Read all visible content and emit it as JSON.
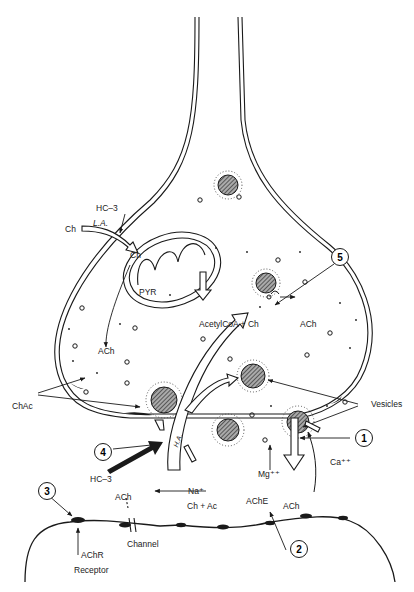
{
  "diagram": {
    "type": "cholinergic synapse schematic",
    "presynaptic": {
      "labels": {
        "hc3_top": "HC–3",
        "ch_outside": "Ch",
        "la": "L.A.",
        "ch_inside": "Ch",
        "pyr": "PYR",
        "ach_left": "ACh",
        "reaction_left": "AcetylCoA + Ch",
        "reaction_right": "ACh",
        "chac": "ChAc",
        "vesicles": "Vesicles",
        "ha": "H.A."
      }
    },
    "cleft": {
      "labels": {
        "hc3_bottom": "HC–3",
        "na": "Na⁺",
        "mg": "Mg⁺⁺",
        "ca": "Ca⁺⁺",
        "ache": "AChE",
        "ach_released": "ACh",
        "ch_plus_ac": "Ch + Ac"
      }
    },
    "postsynaptic": {
      "labels": {
        "ach_channel": "ACh",
        "channel": "Channel",
        "achr": "AChR",
        "receptor": "Receptor"
      }
    },
    "callouts": [
      "1",
      "2",
      "3",
      "4",
      "5"
    ],
    "colors": {
      "ink": "#1a1a1a",
      "background": "#ffffff",
      "hatch": "#555555"
    }
  }
}
